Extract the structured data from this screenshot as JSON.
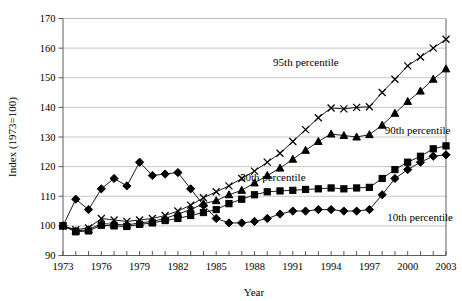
{
  "chart_data": {
    "type": "line",
    "title": "",
    "xlabel": "Year",
    "ylabel": "Index (1973=100)",
    "xlim": [
      1973,
      2003
    ],
    "ylim": [
      90,
      170
    ],
    "ytick_step": 10,
    "yticks": [
      90,
      100,
      110,
      120,
      130,
      140,
      150,
      160,
      170
    ],
    "xticks_labeled": [
      1973,
      1976,
      1979,
      1982,
      1985,
      1988,
      1991,
      1994,
      1997,
      2000,
      2003
    ],
    "xticks_all": [
      1973,
      1974,
      1975,
      1976,
      1977,
      1978,
      1979,
      1980,
      1981,
      1982,
      1983,
      1984,
      1985,
      1986,
      1987,
      1988,
      1989,
      1990,
      1991,
      1992,
      1993,
      1994,
      1995,
      1996,
      1997,
      1998,
      1999,
      2000,
      2001,
      2002,
      2003
    ],
    "grid": "horizontal",
    "legend_position": "inline-annotations",
    "x": [
      1973,
      1974,
      1975,
      1976,
      1977,
      1978,
      1979,
      1980,
      1981,
      1982,
      1983,
      1984,
      1985,
      1986,
      1987,
      1988,
      1989,
      1990,
      1991,
      1992,
      1993,
      1994,
      1995,
      1996,
      1997,
      1998,
      1999,
      2000,
      2001,
      2002,
      2003
    ],
    "series": [
      {
        "name": "95th percentile",
        "marker": "x",
        "label": "95th percentile",
        "values": [
          100.0,
          98.7,
          99.3,
          102.5,
          102.0,
          101.5,
          102.0,
          102.5,
          103.5,
          105.0,
          107.0,
          109.5,
          111.5,
          113.5,
          116.0,
          118.5,
          121.5,
          124.5,
          128.5,
          132.5,
          136.5,
          139.8,
          139.5,
          140.0,
          140.2,
          145.0,
          149.5,
          154.0,
          157.0,
          160.0,
          163.0
        ]
      },
      {
        "name": "90th percentile",
        "marker": "triangle",
        "label": "90th percentile",
        "values": [
          100.0,
          98.3,
          98.7,
          100.8,
          100.5,
          100.3,
          101.0,
          101.5,
          102.5,
          104.0,
          105.5,
          107.5,
          108.5,
          110.5,
          112.0,
          114.5,
          117.0,
          119.5,
          122.5,
          125.5,
          128.5,
          131.0,
          130.5,
          130.0,
          130.8,
          134.0,
          138.0,
          142.0,
          145.5,
          149.5,
          153.0
        ]
      },
      {
        "name": "50th percentile",
        "marker": "square",
        "label": "50th percentile",
        "values": [
          100.0,
          98.0,
          98.3,
          100.2,
          100.0,
          99.8,
          100.5,
          101.0,
          101.8,
          102.5,
          103.5,
          104.5,
          105.5,
          107.5,
          109.0,
          110.5,
          111.5,
          111.8,
          112.0,
          112.3,
          112.5,
          112.8,
          112.5,
          112.8,
          113.0,
          116.0,
          119.0,
          121.5,
          123.5,
          126.0,
          127.0
        ]
      },
      {
        "name": "10th percentile",
        "marker": "diamond",
        "label": "10th percentile",
        "values": [
          100.0,
          109.0,
          105.5,
          112.5,
          116.0,
          113.5,
          121.5,
          117.0,
          117.5,
          118.0,
          112.5,
          107.0,
          102.5,
          101.0,
          101.0,
          101.5,
          102.5,
          104.0,
          105.0,
          105.0,
          105.5,
          105.5,
          105.0,
          105.0,
          105.5,
          110.5,
          116.0,
          119.0,
          121.5,
          123.5,
          124.0
        ]
      }
    ]
  },
  "annotations": [
    {
      "text": "95th percentile",
      "x": 1994.6,
      "y": 154.0,
      "anchor": "end"
    },
    {
      "text": "90th percentile",
      "x": 1998.2,
      "y": 131.0,
      "anchor": "start"
    },
    {
      "text": "50th percentile",
      "x": 1992.0,
      "y": 115.0,
      "anchor": "end"
    },
    {
      "text": "10th percentile",
      "x": 1998.4,
      "y": 101.5,
      "anchor": "start"
    }
  ]
}
